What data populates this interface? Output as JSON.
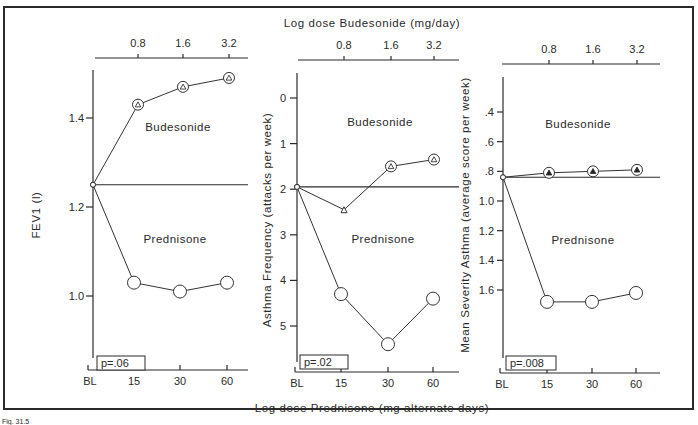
{
  "figure": {
    "top_axis_title": "Log dose Budesonide (mg/day)",
    "bottom_axis_title": "Log dose Prednisone (mg alternate days)",
    "caption_fragment": "Fig. 31.5"
  },
  "chart_data": [
    {
      "type": "line",
      "panel": "FEV1",
      "ylabel": "FEV1  (l)",
      "ylim": [
        0.85,
        1.52
      ],
      "yticks": [
        1.0,
        1.2,
        1.4
      ],
      "ytick_labels": [
        "1.0",
        "1.2",
        "1.4"
      ],
      "y_inverted": false,
      "x_bottom_ticks": [
        "BL",
        "15",
        "30",
        "60"
      ],
      "x_top_ticks": [
        "0.8",
        "1.6",
        "3.2"
      ],
      "baseline": 1.25,
      "region_labels": {
        "upper": "Budesonide",
        "lower": "Prednisone"
      },
      "p_value": "p=.06",
      "series": [
        {
          "name": "Budesonide",
          "marker": "circle-open-triangle",
          "x": [
            "BL",
            "0.8",
            "1.6",
            "3.2"
          ],
          "values": [
            1.25,
            1.43,
            1.47,
            1.49
          ]
        },
        {
          "name": "Prednisone",
          "marker": "circle-open",
          "x": [
            "BL",
            "15",
            "30",
            "60"
          ],
          "values": [
            1.25,
            1.03,
            1.01,
            1.03
          ]
        }
      ]
    },
    {
      "type": "line",
      "panel": "Asthma Frequency",
      "ylabel": "Asthma Frequency (attacks per week)",
      "ylim": [
        -0.45,
        5.8
      ],
      "yticks": [
        0,
        1,
        2,
        3,
        4,
        5
      ],
      "ytick_labels": [
        "0",
        "1",
        "2",
        "3",
        "4",
        "5"
      ],
      "y_inverted": true,
      "x_bottom_ticks": [
        "BL",
        "15",
        "30",
        "60"
      ],
      "x_top_ticks": [
        "0.8",
        "1.6",
        "3.2"
      ],
      "baseline": 1.95,
      "region_labels": {
        "upper": "Budesonide",
        "lower": "Prednisone"
      },
      "p_value": "p=.02",
      "series": [
        {
          "name": "Budesonide",
          "marker": "circle-open-triangle",
          "x": [
            "BL",
            "0.8",
            "1.6",
            "3.2"
          ],
          "values": [
            1.95,
            2.45,
            1.5,
            1.35
          ]
        },
        {
          "name": "Prednisone",
          "marker": "circle-open",
          "x": [
            "BL",
            "15",
            "30",
            "60"
          ],
          "values": [
            1.95,
            4.3,
            5.4,
            4.4
          ]
        }
      ]
    },
    {
      "type": "line",
      "panel": "Mean Severity Asthma",
      "ylabel": "Mean Severity Asthma (average score per week)",
      "ylim": [
        0.22,
        1.78
      ],
      "yticks": [
        0.4,
        0.6,
        0.8,
        1.0,
        1.2,
        1.4,
        1.6
      ],
      "ytick_labels": [
        ".4",
        ".6",
        ".8",
        "1.0",
        "1.2",
        "1.4",
        "1.6"
      ],
      "y_inverted": true,
      "x_bottom_ticks": [
        "BL",
        "15",
        "30",
        "60"
      ],
      "x_top_ticks": [
        "0.8",
        "1.6",
        "3.2"
      ],
      "baseline": 0.84,
      "region_labels": {
        "upper": "Budesonide",
        "lower": "Prednisone"
      },
      "p_value": "p=.008",
      "series": [
        {
          "name": "Budesonide",
          "marker": "circle-filled-triangle",
          "x": [
            "BL",
            "0.8",
            "1.6",
            "3.2"
          ],
          "values": [
            0.84,
            0.81,
            0.8,
            0.79
          ]
        },
        {
          "name": "Prednisone",
          "marker": "circle-open",
          "x": [
            "BL",
            "15",
            "30",
            "60"
          ],
          "values": [
            0.84,
            1.68,
            1.68,
            1.62
          ]
        }
      ]
    }
  ]
}
